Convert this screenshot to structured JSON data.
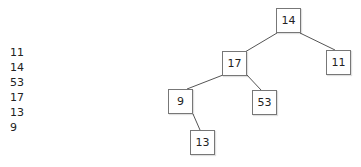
{
  "input_sequence": {
    "items": [
      "11",
      "14",
      "53",
      "17",
      "13",
      "9"
    ]
  },
  "tree": {
    "root": "14",
    "nodes": [
      {
        "id": "n14",
        "label": "14",
        "x": 276,
        "y": 8
      },
      {
        "id": "n17",
        "label": "17",
        "x": 222,
        "y": 51
      },
      {
        "id": "n11",
        "label": "11",
        "x": 326,
        "y": 50
      },
      {
        "id": "n9",
        "label": "9",
        "x": 168,
        "y": 89
      },
      {
        "id": "n53",
        "label": "53",
        "x": 252,
        "y": 90
      },
      {
        "id": "n13",
        "label": "13",
        "x": 190,
        "y": 130
      }
    ],
    "edges": [
      {
        "from": "14",
        "to": "17",
        "side": "left"
      },
      {
        "from": "14",
        "to": "11",
        "side": "right"
      },
      {
        "from": "17",
        "to": "9",
        "side": "left"
      },
      {
        "from": "17",
        "to": "53",
        "side": "right"
      },
      {
        "from": "9",
        "to": "13",
        "side": "right"
      }
    ]
  },
  "colors": {
    "node_border": "#777777",
    "edge": "#555555",
    "text": "#222222",
    "background": "#ffffff"
  }
}
